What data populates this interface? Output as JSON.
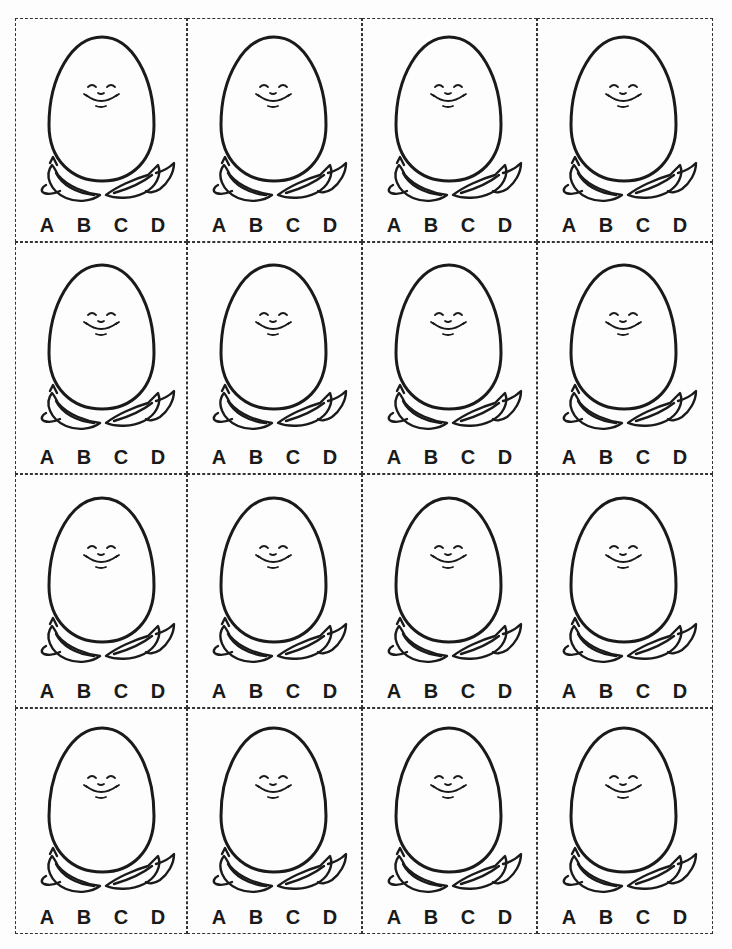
{
  "worksheet": {
    "description": "Printable egg cards with multiple choice answer letters",
    "rows": 4,
    "columns": 4,
    "card": {
      "image": "smiling-egg-in-cracked-shell",
      "choices": [
        "A",
        "B",
        "C",
        "D"
      ]
    },
    "colors": {
      "line": "#1a1a1a",
      "background": "#fdfdfd"
    }
  },
  "cards": [
    {
      "choices": [
        "A",
        "B",
        "C",
        "D"
      ]
    },
    {
      "choices": [
        "A",
        "B",
        "C",
        "D"
      ]
    },
    {
      "choices": [
        "A",
        "B",
        "C",
        "D"
      ]
    },
    {
      "choices": [
        "A",
        "B",
        "C",
        "D"
      ]
    },
    {
      "choices": [
        "A",
        "B",
        "C",
        "D"
      ]
    },
    {
      "choices": [
        "A",
        "B",
        "C",
        "D"
      ]
    },
    {
      "choices": [
        "A",
        "B",
        "C",
        "D"
      ]
    },
    {
      "choices": [
        "A",
        "B",
        "C",
        "D"
      ]
    },
    {
      "choices": [
        "A",
        "B",
        "C",
        "D"
      ]
    },
    {
      "choices": [
        "A",
        "B",
        "C",
        "D"
      ]
    },
    {
      "choices": [
        "A",
        "B",
        "C",
        "D"
      ]
    },
    {
      "choices": [
        "A",
        "B",
        "C",
        "D"
      ]
    },
    {
      "choices": [
        "A",
        "B",
        "C",
        "D"
      ]
    },
    {
      "choices": [
        "A",
        "B",
        "C",
        "D"
      ]
    },
    {
      "choices": [
        "A",
        "B",
        "C",
        "D"
      ]
    },
    {
      "choices": [
        "A",
        "B",
        "C",
        "D"
      ]
    }
  ]
}
